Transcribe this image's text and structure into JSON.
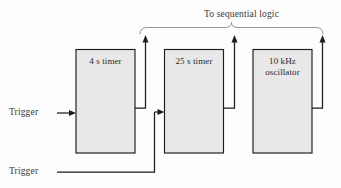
{
  "figure": {
    "title_note": "To sequential logic",
    "blocks": [
      {
        "id": "timer-4s",
        "label": "4 s timer"
      },
      {
        "id": "timer-25s",
        "label": "25 s timer"
      },
      {
        "id": "osc-10khz",
        "label": "10 kHz\noscillator"
      }
    ],
    "inputs": [
      {
        "id": "trigger-top",
        "label": "Trigger"
      },
      {
        "id": "trigger-bottom",
        "label": "Trigger"
      }
    ],
    "colors": {
      "block_fill": "#e8e8e8",
      "line": "#1d1d1d",
      "bracket": "#8a8a8a",
      "text": "#2a2a2a",
      "background": "#fdfdfd"
    }
  }
}
